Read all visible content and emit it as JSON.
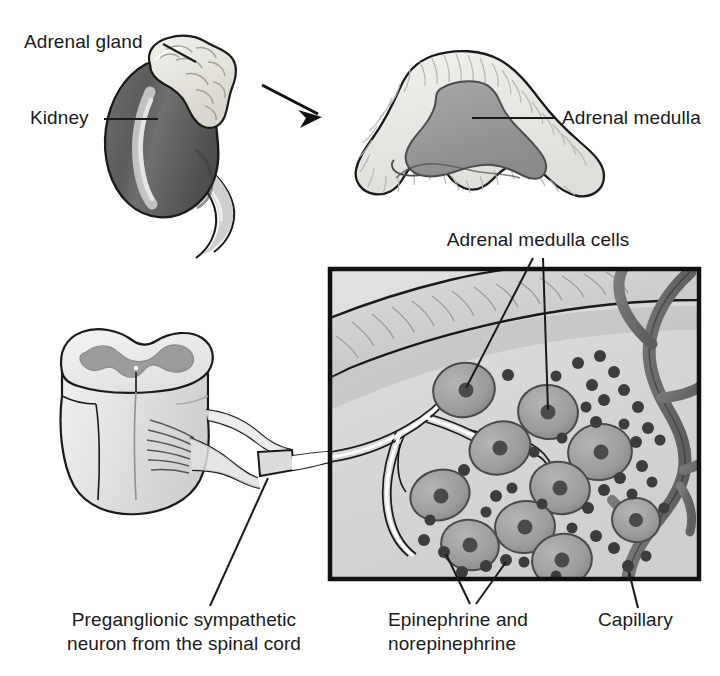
{
  "figure": {
    "background_color": "#ffffff",
    "width": 720,
    "height": 676
  },
  "palette": {
    "outline": "#1a1a1a",
    "kidney_dark": "#575757",
    "kidney_mid": "#6e6e6e",
    "kidney_highlight": "#d8d8d8",
    "adrenal_gland_light": "#e8e6e0",
    "cortex_light": "#e9e9e6",
    "medulla_gray": "#9a9a9a",
    "inset_background": "#d9d9d9",
    "inset_band": "#c9c9c9",
    "cell_body": "#a0a0a0",
    "cell_nucleus": "#4f4f4f",
    "granule": "#3c3c3c",
    "capillary": "#6b6b6b",
    "nerve_white": "#ffffff",
    "spinal_cord_light": "#e4e4e4",
    "spinal_gray_matter": "#9b9b9b",
    "leader_line": "#1a1a1a"
  },
  "labels": {
    "adrenal_gland": "Adrenal gland",
    "kidney": "Kidney",
    "adrenal_medulla": "Adrenal medulla",
    "adrenal_medulla_cells": "Adrenal medulla cells",
    "preganglionic_line1": "Preganglionic sympathetic",
    "preganglionic_line2": "neuron from the spinal cord",
    "epinephrine_line1": "Epinephrine and",
    "epinephrine_line2": "norepinephrine",
    "capillary": "Capillary"
  },
  "structures": {
    "kidney": "kidney-bean-shaped organ, dark gray with pale highlight stripe",
    "adrenal_gland": "pale lumpy cap sitting on top of the kidney",
    "cross_section": "triangular adrenal gland cross-section: pale striated cortex enclosing a darker gray medulla",
    "spinal_cord": "cylindrical spinal cord segment with butterfly-shaped gray matter and emerging nerve rootlets",
    "inset": "boxed micrograph view of the adrenal medulla",
    "arrow": "black arrow pointing from the kidney to the cross-section"
  },
  "inset_contents": {
    "cortex_band": "diagonal striated cortex band across the upper-left",
    "medulla_cells": 10,
    "granule_count": 42,
    "capillary": "dark branching vessel along the right edge",
    "nerve_fibers": "white preganglionic axons entering from the left and synapsing on cells"
  }
}
